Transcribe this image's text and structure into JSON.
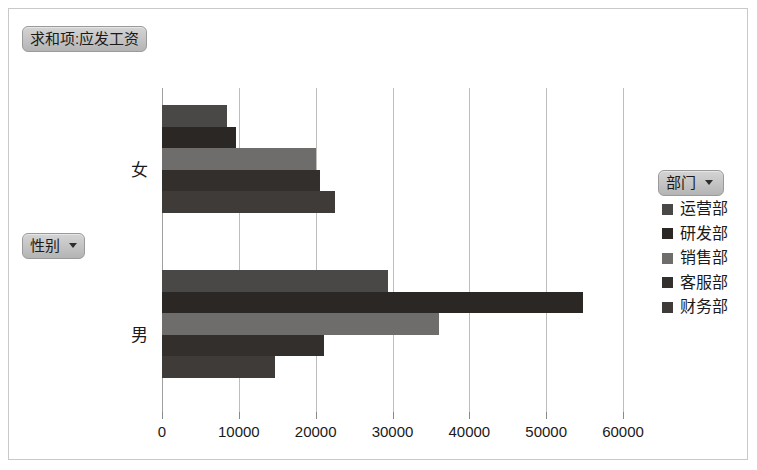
{
  "chart_title": "求和项:应发工资",
  "row_field_button": {
    "label": "性别",
    "caret": "chevron-down-icon"
  },
  "legend_field_button": {
    "label": "部门",
    "caret": "chevron-down-icon"
  },
  "axis": {
    "x_ticks": [
      "0",
      "10000",
      "20000",
      "30000",
      "40000",
      "50000",
      "60000"
    ],
    "y_categories": [
      "女",
      "男"
    ]
  },
  "legend": {
    "title": "部门",
    "entries": [
      {
        "label": "运营部",
        "color": "#4a4846"
      },
      {
        "label": "研发部",
        "color": "#2b2725"
      },
      {
        "label": "销售部",
        "color": "#6f6d6b"
      },
      {
        "label": "客服部",
        "color": "#332f2d"
      },
      {
        "label": "财务部",
        "color": "#3f3b39"
      }
    ]
  },
  "chart_data": {
    "type": "bar",
    "orientation": "horizontal",
    "title": "求和项:应发工资",
    "xlabel": "",
    "ylabel": "性别",
    "xlim": [
      0,
      60000
    ],
    "xticks": [
      0,
      10000,
      20000,
      30000,
      40000,
      50000,
      60000
    ],
    "grid": true,
    "legend_position": "right",
    "legend_title": "部门",
    "categories": [
      "女",
      "男"
    ],
    "series": [
      {
        "name": "运营部",
        "color": "#4a4846",
        "values": [
          8500,
          29400
        ]
      },
      {
        "name": "研发部",
        "color": "#2b2725",
        "values": [
          9600,
          54800
        ]
      },
      {
        "name": "销售部",
        "color": "#6f6d6b",
        "values": [
          20000,
          36000
        ]
      },
      {
        "name": "客服部",
        "color": "#332f2d",
        "values": [
          20600,
          21100
        ]
      },
      {
        "name": "财务部",
        "color": "#3f3b39",
        "values": [
          22500,
          14700
        ]
      }
    ]
  }
}
